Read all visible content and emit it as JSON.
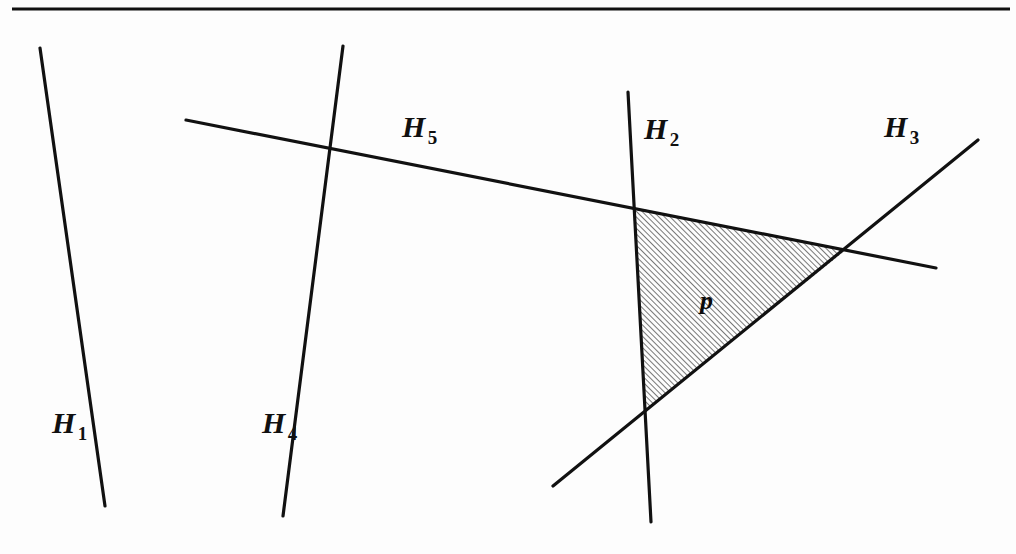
{
  "figure": {
    "background_color": "#fdfdfd",
    "ink_color": "#111111",
    "rule": {
      "name": "top-horizontal-rule",
      "x1": 12,
      "y1": 9,
      "x2": 1010,
      "y2": 9,
      "thickness": 3
    },
    "labels": {
      "h1": {
        "text": "H",
        "sub": "1"
      },
      "h2": {
        "text": "H",
        "sub": "2"
      },
      "h3": {
        "text": "H",
        "sub": "3"
      },
      "h4": {
        "text": "H",
        "sub": "4"
      },
      "h5": {
        "text": "H",
        "sub": "5"
      },
      "cell": {
        "text": "p"
      }
    },
    "lines": [
      {
        "id": "H1",
        "name": "hyperplane-h1",
        "x1": 40,
        "y1": 48,
        "x2": 105,
        "y2": 506,
        "width": 3.2
      },
      {
        "id": "H4",
        "name": "hyperplane-h4",
        "x1": 343,
        "y1": 46,
        "x2": 283,
        "y2": 516,
        "width": 3.2
      },
      {
        "id": "H5",
        "name": "hyperplane-h5",
        "x1": 186,
        "y1": 120,
        "x2": 936,
        "y2": 268,
        "width": 3.2
      },
      {
        "id": "H2",
        "name": "hyperplane-h2",
        "x1": 628,
        "y1": 92,
        "x2": 651,
        "y2": 522,
        "width": 3.2
      },
      {
        "id": "H3",
        "name": "hyperplane-h3",
        "x1": 553,
        "y1": 486,
        "x2": 978,
        "y2": 140,
        "width": 3.2
      }
    ],
    "intersections": [
      {
        "name": "h1-h4-crossing",
        "x": 190,
        "y": 338
      },
      {
        "name": "h4-h5-crossing",
        "x": 292,
        "y": 142
      },
      {
        "name": "h5-h2-crossing",
        "x": 633,
        "y": 207
      },
      {
        "name": "h5-h3-crossing",
        "x": 846,
        "y": 250
      },
      {
        "name": "h2-h3-crossing",
        "x": 645,
        "y": 411
      }
    ],
    "shaded_cell": {
      "name": "shaded-cell-p",
      "label": "p",
      "bounded_by": [
        "H5",
        "H3",
        "H2"
      ],
      "vertices": [
        {
          "x": 633,
          "y": 207
        },
        {
          "x": 846,
          "y": 250
        },
        {
          "x": 645,
          "y": 411
        }
      ],
      "fill": "hatch-diagonal",
      "hatch_angle_deg": 45,
      "hatch_spacing_px": 4,
      "hatch_color": "#141414",
      "hatch_line_width": 1.1
    }
  }
}
